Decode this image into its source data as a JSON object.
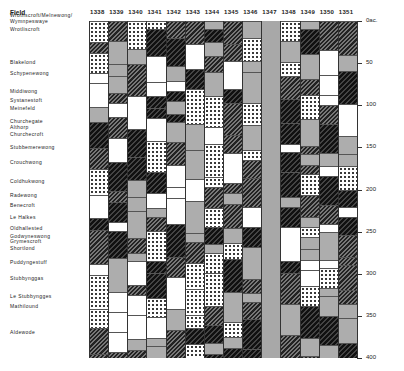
{
  "chart_data": {
    "type": "table",
    "title": "",
    "xlabel": "Year",
    "ylabel": "Field (cumulative acreage)",
    "header_label": "Field",
    "years": [
      "1338",
      "1339",
      "1340",
      "1341",
      "1342",
      "1343",
      "1344",
      "1345",
      "1346",
      "1347",
      "1348",
      "1349",
      "1350",
      "1351"
    ],
    "fields": [
      "Wrotliscroft/Melnewong/ Wymnpeswaye",
      "Wrotliscroft",
      "Blakelond",
      "Schypenewong",
      "Middiwong",
      "Systanestoft",
      "Meinefeld",
      "Churchegate",
      "Althorp",
      "Churchecroft",
      "Stubbemerewong",
      "Crouchwong",
      "Coldhukwong",
      "Radewong",
      "Benecroft",
      "Le Halkes",
      "Oldhallested",
      "Godwyneswong",
      "Grymescroft",
      "Shortlond",
      "Puddyngestuff",
      "Stubbynggas",
      "Le Stubbyngges",
      "Mathilound",
      "Aldewode"
    ],
    "y_axis": {
      "label": "Oac.",
      "ticks": [
        0,
        50,
        100,
        150,
        200,
        250,
        300,
        350,
        400
      ],
      "range": [
        0,
        400
      ]
    },
    "legend_patterns": [
      "white (fallow/unrecorded)",
      "dots",
      "diagonal hatch",
      "dark hatch",
      "stipple",
      "solid grey"
    ],
    "note": "Column 1347 shaded solid grey across all fields"
  },
  "axis_labels": {
    "t0": "0ac.",
    "t50": "50",
    "t100": "100",
    "t150": "150",
    "t200": "200",
    "t250": "250",
    "t300": "300",
    "t350": "350",
    "t400": "400"
  },
  "field_positions": [
    12,
    26,
    59,
    70,
    88,
    97,
    105,
    118,
    124,
    131,
    144,
    159,
    178,
    192,
    202,
    214,
    225,
    233,
    238,
    245,
    259,
    275,
    293,
    303,
    329
  ]
}
